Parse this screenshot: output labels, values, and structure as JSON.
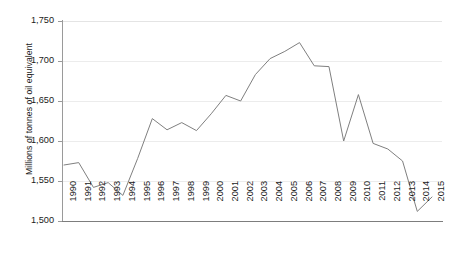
{
  "chart_data": {
    "type": "line",
    "title": "",
    "xlabel": "",
    "ylabel": "Millions of tonnes of oil equivalent",
    "xlim": [
      1990,
      2015
    ],
    "ylim": [
      1500,
      1750
    ],
    "grid": true,
    "legend": "none",
    "line_color": "#7f7f7f",
    "categories": [
      "1990",
      "1991",
      "1992",
      "1993",
      "1994",
      "1995",
      "1996",
      "1997",
      "1998",
      "1999",
      "2000",
      "2001",
      "2002",
      "2003",
      "2004",
      "2005",
      "2006",
      "2007",
      "2008",
      "2009",
      "2010",
      "2011",
      "2012",
      "2013",
      "2014",
      "2015"
    ],
    "x": [
      1990,
      1991,
      1992,
      1993,
      1994,
      1995,
      1996,
      1997,
      1998,
      1999,
      2000,
      2001,
      2002,
      2003,
      2004,
      2005,
      2006,
      2007,
      2008,
      2009,
      2010,
      2011,
      2012,
      2013,
      2014,
      2015
    ],
    "values": [
      1570,
      1573,
      1542,
      1548,
      1532,
      1578,
      1628,
      1614,
      1623,
      1613,
      1634,
      1657,
      1650,
      1683,
      1703,
      1712,
      1723,
      1694,
      1693,
      1600,
      1658,
      1597,
      1590,
      1575,
      1512,
      1530
    ],
    "yticks": [
      1500,
      1550,
      1600,
      1650,
      1700,
      1750
    ],
    "ytick_labels": [
      "1,500",
      "1,550",
      "1,600",
      "1,650",
      "1,700",
      "1,750"
    ]
  },
  "axis": {
    "y_title": "Millions of tonnes of oil equivalent"
  }
}
